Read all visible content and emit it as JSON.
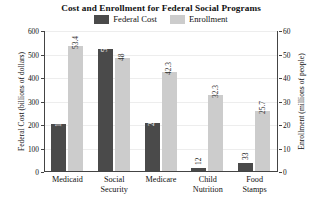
{
  "chart_data": {
    "type": "bar",
    "title": "Cost and Enrollment for Federal Social Programs",
    "categories": [
      "Medicaid",
      "Social\nSecurity",
      "Medicare",
      "Child\nNutrition",
      "Food\nStamps"
    ],
    "series": [
      {
        "name": "Federal Cost",
        "axis": "left",
        "color": "#4a4a4a",
        "values": [
          198,
          519,
          204,
          12,
          33
        ],
        "labels": [
          "198",
          "519",
          "204",
          "12",
          "33"
        ]
      },
      {
        "name": "Enrollment",
        "axis": "right",
        "color": "#cccccc",
        "values": [
          53.4,
          48,
          42.3,
          32.3,
          25.7
        ],
        "labels": [
          "53.4",
          "48",
          "42.3",
          "32.3",
          "25.7"
        ]
      }
    ],
    "xlabel": "",
    "ylabel": "Federal Cost (billions of dollars)",
    "y2label": "Enrollment (millions of people)",
    "ylim": [
      0,
      600
    ],
    "y2lim": [
      0,
      60
    ],
    "yticks": [
      "0",
      "100",
      "200",
      "300",
      "400",
      "500",
      "600"
    ],
    "y2ticks": [
      "0",
      "10",
      "20",
      "30",
      "40",
      "50",
      "60"
    ],
    "grid": true,
    "legend_position": "top-center"
  },
  "legend": {
    "items": [
      {
        "label": "Federal Cost",
        "color": "#4a4a4a"
      },
      {
        "label": "Enrollment",
        "color": "#cccccc"
      }
    ]
  }
}
